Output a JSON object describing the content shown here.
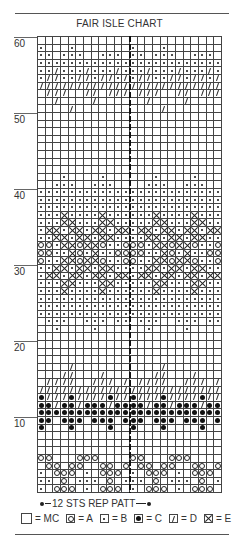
{
  "title": "FAIR ISLE CHART",
  "y_labels": [
    {
      "label": "60",
      "row": 60
    },
    {
      "label": "50",
      "row": 50
    },
    {
      "label": "40",
      "row": 40
    },
    {
      "label": "30",
      "row": 30
    },
    {
      "label": "20",
      "row": 20
    },
    {
      "label": "10",
      "row": 10
    }
  ],
  "grid": {
    "columns": 24,
    "rows": 60,
    "repeat": 12
  },
  "pattern_rows_top_to_bottom": [
    "............",
    "b...b.......",
    "bb.bbb..bbb.",
    "bbbbbbbbbbbb",
    "bbdbbbdbbbdb",
    "bddbbddbddbd",
    "dddddddddddd",
    ".ddd..dd.ddd",
    "..d....d....",
    "....d.......",
    "............",
    "............",
    "............",
    "............",
    "............",
    "............",
    "............",
    "............",
    "...b....b...",
    "..bbb..bbb..",
    "bbbbbbbbbbbb",
    "bbbbbbbbbbbb",
    "bbbbbbbbbbbb",
    "bbbxbbbbxbbb",
    "bbbxxbbbxxbb",
    "bxxbxxbxxbxx",
    "bbxxbxxbxxbb",
    "oobxxoxxobbo",
    "oobbxobxbboo",
    "obbxxoxxobbo",
    "bbxxbxxbxxbb",
    "bxxbxxbxxbxx",
    "bbbxxbbbxxbb",
    "bbbxbbbbxbbb",
    "bbbbbbbbbbbb",
    "bbbbbbbbbbbb",
    "bbbbbbbbbbbb",
    ".bbb..bbb.bb",
    "..b....b....",
    "............",
    "............",
    "............",
    "............",
    "....d.......",
    "...dd...d...",
    ".dddd..ddd.d",
    "dddddddddddd",
    "cdddcddddcdd",
    "ccdccdcccdcc",
    "cccccccccccc",
    "cc.ccc.ccc.c",
    "c...c....c..",
    "............",
    "............",
    "............",
    "oo...ooo....",
    ".oo.oo..oo.o",
    "b.ooo.b.ooo.",
    "bb.o.bbb.o.b",
    "b.ooo.b.ooo.",
    ".oo.oo..oo.o",
    "oo...ooo....",
    "............",
    "............",
    "............",
    "............"
  ],
  "repeat_label": "12 STS REP PATT",
  "legend": [
    {
      "symbol": "empty",
      "label": "= MC"
    },
    {
      "symbol": "o",
      "label": "= A"
    },
    {
      "symbol": "b",
      "label": "= B"
    },
    {
      "symbol": "c",
      "label": "= C"
    },
    {
      "symbol": "d",
      "label": "= D"
    },
    {
      "symbol": "x",
      "label": "= E"
    }
  ]
}
